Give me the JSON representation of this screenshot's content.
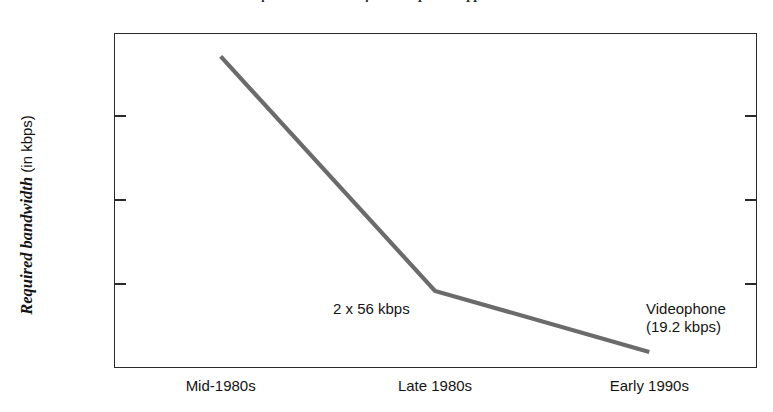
{
  "chart_data": {
    "type": "line",
    "title": "Required Bandwidth for Videophone Applications",
    "xlabel": "",
    "ylabel": "Required bandwidth (in kbps)",
    "ylabel_emphasis": "Required bandwidth",
    "ylabel_plain": "(in kbps)",
    "categories": [
      "Mid-1980s",
      "Late 1980s",
      "Early 1990s"
    ],
    "values": [
      372,
      92,
      19.2
    ],
    "series": [
      {
        "name": "Required bandwidth",
        "values": [
          372,
          92,
          19.2
        ],
        "color": "#6b6b6b"
      }
    ],
    "ylim": [
      0,
      400
    ],
    "yticks": [
      0,
      100,
      200,
      300,
      400
    ],
    "ytick_labels": [
      "0",
      "100",
      "200",
      "300",
      "400"
    ],
    "grid": false,
    "legend": false,
    "annotations": [
      {
        "text": "2 x 56 kbps",
        "near_category": "Late 1980s"
      },
      {
        "text_line1": "Videophone",
        "text_line2": "(19.2 kbps)",
        "near_category": "Early 1990s"
      }
    ]
  },
  "axis": {
    "y_ticks": [
      {
        "label": "400",
        "value": 400
      },
      {
        "label": "300",
        "value": 300
      },
      {
        "label": "200",
        "value": 200
      },
      {
        "label": "100",
        "value": 100
      },
      {
        "label": "0",
        "value": 0
      }
    ],
    "x_ticks": [
      {
        "label": "Mid-1980s"
      },
      {
        "label": "Late 1980s"
      },
      {
        "label": "Early 1990s"
      }
    ]
  },
  "annotations": {
    "mid": "2 x 56 kbps",
    "right_line1": "Videophone",
    "right_line2": "(19.2 kbps)"
  },
  "colors": {
    "series_line": "#6b6b6b",
    "axis": "#2a2a2a",
    "text": "#141414",
    "background": "#ffffff"
  }
}
